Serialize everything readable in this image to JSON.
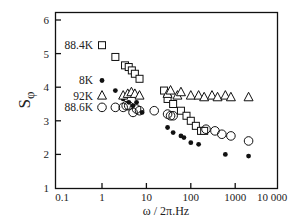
{
  "chart_data": {
    "type": "scatter",
    "title": "",
    "xlabel": "ω / 2π.Hz",
    "ylabel": "S",
    "ylabel_subscript": "φ",
    "xscale": "log",
    "xlim": [
      0.1,
      10000
    ],
    "ylim": [
      1,
      6
    ],
    "xticks": [
      "0.1",
      "1",
      "10",
      "100",
      "1000",
      "10 000"
    ],
    "yticks": [
      "1",
      "2",
      "3",
      "4",
      "5",
      "6"
    ],
    "grid": false,
    "legend_position": "inline-left",
    "series": [
      {
        "name": "88.4K",
        "marker": "open-square",
        "x": [
          1,
          2,
          3.3,
          4,
          4.7,
          5.5,
          7,
          25,
          30,
          40,
          60,
          80,
          100,
          130,
          170,
          200
        ],
        "y": [
          5.25,
          4.9,
          4.65,
          4.6,
          4.5,
          4.4,
          4.25,
          3.9,
          3.65,
          3.5,
          3.3,
          3.15,
          3.0,
          2.85,
          2.7,
          2.7
        ]
      },
      {
        "name": "8K",
        "marker": "filled-circle",
        "x": [
          1,
          2,
          3,
          4,
          5,
          6,
          8,
          30,
          40,
          60,
          70,
          100,
          150,
          600,
          2000
        ],
        "y": [
          4.2,
          3.9,
          3.65,
          3.55,
          3.45,
          3.55,
          3.25,
          2.8,
          2.65,
          2.55,
          2.5,
          2.35,
          2.3,
          2.0,
          1.95
        ]
      },
      {
        "name": "92K",
        "marker": "open-triangle",
        "x": [
          1,
          3,
          3.8,
          4.6,
          5.5,
          7,
          30,
          35,
          50,
          60,
          100,
          150,
          200,
          300,
          400,
          600,
          800,
          2000
        ],
        "y": [
          3.75,
          3.75,
          3.8,
          3.85,
          3.8,
          3.75,
          3.8,
          3.9,
          3.75,
          3.85,
          3.75,
          3.75,
          3.7,
          3.75,
          3.7,
          3.75,
          3.7,
          3.7
        ]
      },
      {
        "name": "88.6K",
        "marker": "open-circle",
        "x": [
          1,
          2,
          3,
          3.5,
          4,
          5,
          6,
          7,
          15,
          30,
          35,
          40,
          220,
          350,
          500,
          800,
          2000
        ],
        "y": [
          3.4,
          3.4,
          3.4,
          3.45,
          3.45,
          3.25,
          3.35,
          3.3,
          3.3,
          3.2,
          3.15,
          3.15,
          2.75,
          2.7,
          2.6,
          2.55,
          2.4
        ]
      }
    ]
  }
}
